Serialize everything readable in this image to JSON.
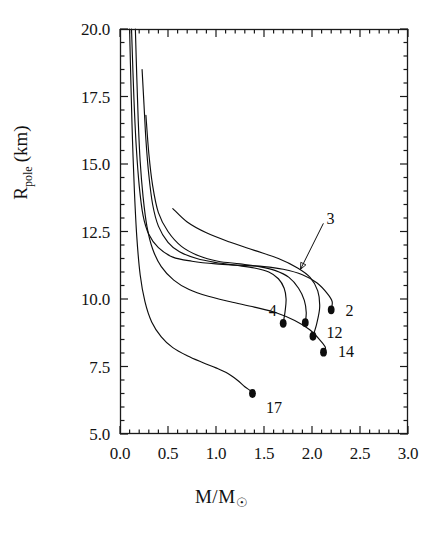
{
  "chart_data": {
    "type": "line",
    "title": "",
    "subtitle": "",
    "xlabel": "M/M☉",
    "ylabel": "R_pole (km)",
    "xlim": [
      0.0,
      3.0
    ],
    "ylim": [
      5.0,
      20.0
    ],
    "grid": false,
    "legend_position": "inline-annotations",
    "xticks": [
      "0.0",
      "0.5",
      "1.0",
      "1.5",
      "2.0",
      "2.5",
      "3.0"
    ],
    "xtick_values": [
      0.0,
      0.5,
      1.0,
      1.5,
      2.0,
      2.5,
      3.0
    ],
    "xminor_per_major": 5,
    "yticks": [
      "20.0",
      "17.5",
      "15.0",
      "12.5",
      "10.0",
      "7.5",
      "5.0"
    ],
    "ytick_values": [
      20.0,
      17.5,
      15.0,
      12.5,
      10.0,
      7.5,
      5.0
    ],
    "yminor_per_major": 5,
    "annotations": [
      {
        "label": "2",
        "x": 2.35,
        "y": 9.55,
        "kind": "endpoint-label"
      },
      {
        "label": "3",
        "x": 2.15,
        "y": 12.95,
        "kind": "leader-label"
      },
      {
        "label": "4",
        "x": 1.55,
        "y": 9.55,
        "kind": "endpoint-label"
      },
      {
        "label": "12",
        "x": 2.15,
        "y": 8.75,
        "kind": "endpoint-label"
      },
      {
        "label": "14",
        "x": 2.27,
        "y": 8.05,
        "kind": "endpoint-label"
      },
      {
        "label": "17",
        "x": 1.52,
        "y": 5.95,
        "kind": "endpoint-label"
      }
    ],
    "endpoint_markers": [
      {
        "series": "2",
        "x": 2.2,
        "y": 9.6
      },
      {
        "series": "4a",
        "x": 1.7,
        "y": 9.1
      },
      {
        "series": "4b",
        "x": 1.93,
        "y": 9.12
      },
      {
        "series": "12",
        "x": 2.01,
        "y": 8.62
      },
      {
        "series": "14",
        "x": 2.12,
        "y": 8.03
      },
      {
        "series": "17",
        "x": 1.38,
        "y": 6.5
      }
    ],
    "series": [
      {
        "name": "2",
        "points": [
          [
            0.12,
            20.0
          ],
          [
            0.135,
            18.4
          ],
          [
            0.15,
            17.0
          ],
          [
            0.17,
            15.6
          ],
          [
            0.2,
            14.2
          ],
          [
            0.24,
            13.1
          ],
          [
            0.3,
            12.4
          ],
          [
            0.4,
            11.9
          ],
          [
            0.55,
            11.55
          ],
          [
            0.75,
            11.4
          ],
          [
            1.0,
            11.3
          ],
          [
            1.25,
            11.25
          ],
          [
            1.5,
            11.2
          ],
          [
            1.7,
            11.1
          ],
          [
            1.9,
            10.9
          ],
          [
            2.05,
            10.6
          ],
          [
            2.16,
            10.2
          ],
          [
            2.21,
            9.9
          ],
          [
            2.2,
            9.6
          ]
        ]
      },
      {
        "name": "3",
        "points": [
          [
            0.55,
            13.35
          ],
          [
            0.7,
            12.85
          ],
          [
            0.9,
            12.45
          ],
          [
            1.15,
            12.1
          ],
          [
            1.4,
            11.8
          ],
          [
            1.65,
            11.5
          ],
          [
            1.85,
            11.15
          ],
          [
            1.98,
            10.8
          ],
          [
            2.06,
            10.3
          ],
          [
            2.08,
            9.7
          ],
          [
            2.05,
            9.1
          ],
          [
            2.01,
            8.62
          ]
        ]
      },
      {
        "name": "4",
        "points": [
          [
            0.23,
            18.5
          ],
          [
            0.25,
            17.2
          ],
          [
            0.27,
            15.9
          ],
          [
            0.3,
            14.6
          ],
          [
            0.34,
            13.5
          ],
          [
            0.4,
            12.7
          ],
          [
            0.5,
            12.1
          ],
          [
            0.62,
            11.75
          ],
          [
            0.8,
            11.5
          ],
          [
            1.0,
            11.35
          ],
          [
            1.2,
            11.25
          ],
          [
            1.4,
            11.15
          ],
          [
            1.55,
            11.0
          ],
          [
            1.65,
            10.75
          ],
          [
            1.71,
            10.4
          ],
          [
            1.73,
            10.0
          ],
          [
            1.72,
            9.55
          ],
          [
            1.7,
            9.1
          ]
        ]
      },
      {
        "name": "4b",
        "points": [
          [
            0.27,
            16.8
          ],
          [
            0.3,
            15.4
          ],
          [
            0.34,
            14.2
          ],
          [
            0.4,
            13.2
          ],
          [
            0.5,
            12.5
          ],
          [
            0.64,
            11.95
          ],
          [
            0.82,
            11.6
          ],
          [
            1.02,
            11.4
          ],
          [
            1.25,
            11.3
          ],
          [
            1.45,
            11.2
          ],
          [
            1.62,
            11.05
          ],
          [
            1.76,
            10.8
          ],
          [
            1.86,
            10.4
          ],
          [
            1.92,
            9.95
          ],
          [
            1.94,
            9.5
          ],
          [
            1.93,
            9.12
          ]
        ]
      },
      {
        "name": "14",
        "points": [
          [
            0.16,
            20.0
          ],
          [
            0.175,
            18.2
          ],
          [
            0.19,
            16.6
          ],
          [
            0.21,
            15.1
          ],
          [
            0.24,
            13.8
          ],
          [
            0.28,
            12.7
          ],
          [
            0.34,
            11.85
          ],
          [
            0.43,
            11.2
          ],
          [
            0.56,
            10.7
          ],
          [
            0.72,
            10.35
          ],
          [
            0.92,
            10.1
          ],
          [
            1.15,
            9.9
          ],
          [
            1.4,
            9.7
          ],
          [
            1.62,
            9.5
          ],
          [
            1.82,
            9.2
          ],
          [
            1.98,
            8.85
          ],
          [
            2.09,
            8.45
          ],
          [
            2.14,
            8.2
          ],
          [
            2.12,
            8.03
          ]
        ]
      },
      {
        "name": "17",
        "points": [
          [
            0.1,
            20.0
          ],
          [
            0.115,
            17.8
          ],
          [
            0.13,
            15.9
          ],
          [
            0.15,
            14.0
          ],
          [
            0.175,
            12.3
          ],
          [
            0.21,
            10.9
          ],
          [
            0.26,
            9.9
          ],
          [
            0.33,
            9.15
          ],
          [
            0.43,
            8.6
          ],
          [
            0.55,
            8.2
          ],
          [
            0.7,
            7.9
          ],
          [
            0.86,
            7.65
          ],
          [
            1.0,
            7.45
          ],
          [
            1.12,
            7.25
          ],
          [
            1.22,
            7.0
          ],
          [
            1.3,
            6.75
          ],
          [
            1.36,
            6.6
          ],
          [
            1.38,
            6.5
          ]
        ]
      }
    ]
  },
  "axes": {
    "x_title_numerator": "M/M",
    "x_title_sun": "☉",
    "y_title_main": "R",
    "y_title_sub": "pole",
    "y_title_unit": "(km)"
  }
}
